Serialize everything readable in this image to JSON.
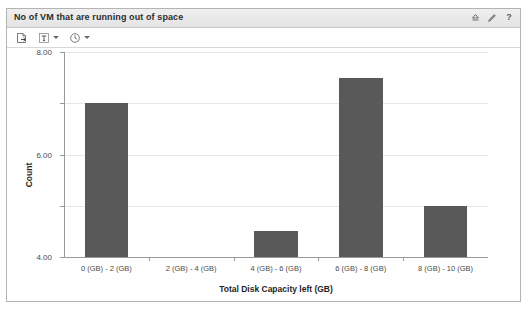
{
  "panel": {
    "title": "No of VM that are running out of space",
    "header_icons": [
      {
        "name": "collapse-icon",
        "glyph": "collapse"
      },
      {
        "name": "edit-pencil-icon",
        "glyph": "pencil"
      },
      {
        "name": "help-icon",
        "glyph": "?"
      }
    ],
    "toolbar": [
      {
        "name": "export-icon",
        "glyph": "export",
        "has_caret": false
      },
      {
        "name": "text-format-icon",
        "glyph": "T",
        "has_caret": true
      },
      {
        "name": "clock-icon",
        "glyph": "clock",
        "has_caret": true
      }
    ]
  },
  "chart_data": {
    "type": "bar",
    "title": "",
    "xlabel": "Total Disk Capacity left (GB)",
    "ylabel": "Count",
    "categories": [
      "0 (GB) - 2 (GB)",
      "2 (GB) - 4 (GB)",
      "4 (GB) - 6 (GB)",
      "6 (GB) - 8 (GB)",
      "8 (GB) - 10 (GB)"
    ],
    "values": [
      6,
      0,
      1,
      7,
      2
    ],
    "ylim": [
      0,
      8
    ],
    "yticks": [
      0,
      2,
      4,
      6,
      8
    ],
    "ytick_labels": [
      "0.00",
      "2.00",
      "4.00",
      "6.00",
      "8.00"
    ],
    "grid": true,
    "legend": false,
    "bar_color": "#595959"
  },
  "colors": {
    "bar": "#595959",
    "header_bg": "#e9e9e9",
    "panel_border": "#b4b4b4",
    "gridline": "#e6e6e6",
    "axis": "#9a9a9a"
  }
}
